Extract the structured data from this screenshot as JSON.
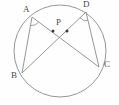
{
  "figure": {
    "background_color": "#fefefe",
    "stroke_color": "#8a8a8a",
    "label_color": "#4a4a4a",
    "width": 119,
    "height": 105
  },
  "circle": {
    "name": "circumscribed-circle",
    "cx": 60,
    "cy": 51,
    "r": 46
  },
  "points": [
    {
      "id": "A",
      "label": "A",
      "x": 32,
      "y": 17,
      "label_x": 23,
      "label_y": 5
    },
    {
      "id": "D",
      "label": "D",
      "x": 86,
      "y": 12,
      "label_x": 83,
      "label_y": 0
    },
    {
      "id": "B",
      "label": "B",
      "x": 22,
      "y": 73,
      "label_x": 11,
      "label_y": 71
    },
    {
      "id": "C",
      "label": "C",
      "x": 99,
      "y": 67,
      "label_x": 104,
      "label_y": 60
    },
    {
      "id": "P",
      "label": "P",
      "x": 60,
      "y": 31,
      "label_x": 56,
      "label_y": 18
    }
  ],
  "chords": [
    {
      "name": "chord-AC",
      "from": "A",
      "to": "C"
    },
    {
      "name": "chord-DB",
      "from": "D",
      "to": "B"
    }
  ],
  "segments": [
    {
      "name": "segment-AB",
      "from": "A",
      "to": "B"
    },
    {
      "name": "segment-DC",
      "from": "D",
      "to": "C"
    }
  ],
  "angle_marks": [
    {
      "name": "angle-mark-at-A",
      "vertex": "A",
      "measure_label": ""
    },
    {
      "name": "angle-mark-at-D",
      "vertex": "D",
      "measure_label": ""
    }
  ],
  "intersection_dots": [
    {
      "name": "angle-dot-left",
      "x": 53,
      "y": 31
    },
    {
      "name": "angle-dot-right",
      "x": 67,
      "y": 31
    }
  ],
  "labels": {
    "A": "A",
    "B": "B",
    "C": "C",
    "D": "D",
    "P": "P"
  }
}
